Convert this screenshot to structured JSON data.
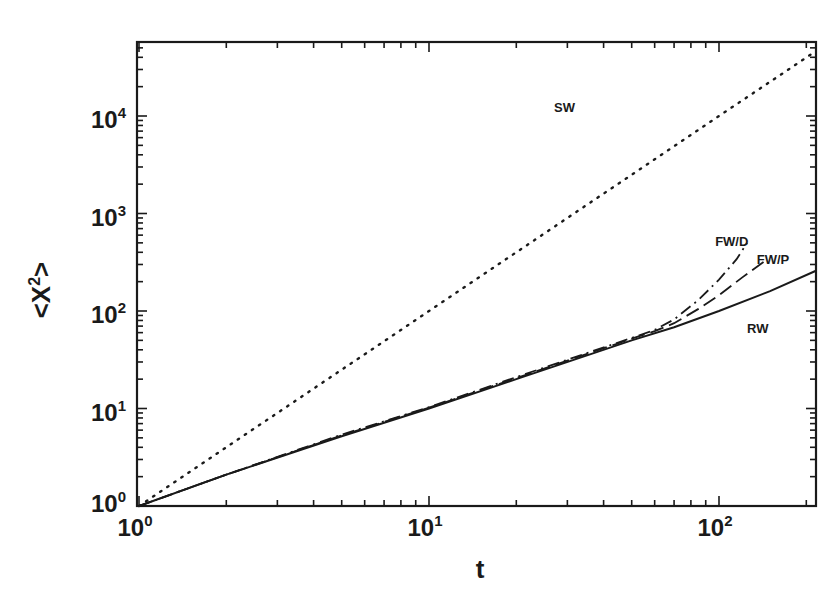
{
  "chart_data": {
    "type": "line",
    "title": "",
    "xlabel": "t",
    "ylabel": "<X2>",
    "ylabel_display": {
      "base": "<X",
      "sup": "2",
      "tail": ">"
    },
    "xscale": "log",
    "yscale": "log",
    "xlim": [
      1,
      215
    ],
    "ylim": [
      1,
      58000
    ],
    "grid": false,
    "legend": "inline labels",
    "x_ticks": [
      {
        "value": 1,
        "base": "10",
        "exp": "0"
      },
      {
        "value": 10,
        "base": "10",
        "exp": "1"
      },
      {
        "value": 100,
        "base": "10",
        "exp": "2"
      }
    ],
    "y_ticks": [
      {
        "value": 1,
        "base": "10",
        "exp": "0"
      },
      {
        "value": 10,
        "base": "10",
        "exp": "1"
      },
      {
        "value": 100,
        "base": "10",
        "exp": "2"
      },
      {
        "value": 1000,
        "base": "10",
        "exp": "3"
      },
      {
        "value": 10000,
        "base": "10",
        "exp": "4"
      }
    ],
    "series": [
      {
        "name": "SW",
        "style": "dotted",
        "x": [
          1,
          2,
          5,
          10,
          20,
          50,
          100,
          215
        ],
        "y": [
          1,
          4,
          25,
          100,
          400,
          2500,
          10000,
          46000
        ],
        "label_pos": {
          "x": 27,
          "y": 11000
        }
      },
      {
        "name": "RW",
        "style": "solid",
        "x": [
          1,
          2,
          5,
          10,
          20,
          50,
          70,
          100,
          150,
          215
        ],
        "y": [
          1,
          2.1,
          5.2,
          10,
          20,
          50,
          68,
          100,
          160,
          257
        ],
        "label_pos": {
          "x": 125,
          "y": 60
        }
      },
      {
        "name": "FW/D",
        "style": "dashdot",
        "x": [
          1,
          2,
          5,
          10,
          20,
          50,
          60,
          70,
          85,
          100,
          115,
          125
        ],
        "y": [
          1,
          2.1,
          5.4,
          10.3,
          21,
          53,
          64,
          82,
          130,
          210,
          340,
          500
        ],
        "label_pos": {
          "x": 97,
          "y": 460
        }
      },
      {
        "name": "FW/P",
        "style": "dashed",
        "x": [
          1,
          2,
          5,
          10,
          20,
          50,
          60,
          70,
          85,
          100,
          120,
          143
        ],
        "y": [
          1,
          2.1,
          5.3,
          10.2,
          20.5,
          52,
          62,
          75,
          105,
          145,
          220,
          320
        ],
        "label_pos": {
          "x": 135,
          "y": 300
        }
      }
    ]
  }
}
